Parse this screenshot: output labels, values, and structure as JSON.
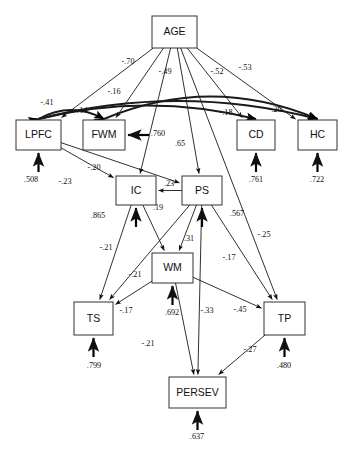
{
  "chart_data": {
    "type": "diagram",
    "diagram_kind": "path-diagram",
    "nodes": [
      {
        "id": "AGE",
        "label": "AGE",
        "x": 152,
        "y": 16,
        "w": 45,
        "h": 32
      },
      {
        "id": "LPFC",
        "label": "LPFC",
        "x": 16,
        "y": 120,
        "w": 45,
        "h": 30
      },
      {
        "id": "FWM",
        "label": "FWM",
        "x": 83,
        "y": 120,
        "w": 42,
        "h": 30
      },
      {
        "id": "CD",
        "label": "CD",
        "x": 237,
        "y": 120,
        "w": 38,
        "h": 30
      },
      {
        "id": "HC",
        "label": "HC",
        "x": 298,
        "y": 120,
        "w": 39,
        "h": 30
      },
      {
        "id": "IC",
        "label": "IC",
        "x": 116,
        "y": 176,
        "w": 40,
        "h": 29
      },
      {
        "id": "PS",
        "label": "PS",
        "x": 182,
        "y": 176,
        "w": 40,
        "h": 29
      },
      {
        "id": "WM",
        "label": "WM",
        "x": 152,
        "y": 253,
        "w": 41,
        "h": 30
      },
      {
        "id": "TS",
        "label": "TS",
        "x": 74,
        "y": 302,
        "w": 39,
        "h": 33
      },
      {
        "id": "TP",
        "label": "TP",
        "x": 264,
        "y": 302,
        "w": 41,
        "h": 33
      },
      {
        "id": "PERSEV",
        "label": "PERSEV",
        "x": 169,
        "y": 377,
        "w": 57,
        "h": 31
      }
    ],
    "paths": [
      {
        "from": "AGE",
        "to": "LPFC",
        "coef": "-.70",
        "label_x": 128,
        "label_y": 62
      },
      {
        "from": "AGE",
        "to": "FWM",
        "coef": "-.49",
        "label_x": 165,
        "label_y": 72
      },
      {
        "from": "AGE",
        "to": "CD",
        "coef": "-.52",
        "label_x": 217,
        "label_y": 72
      },
      {
        "from": "AGE",
        "to": "HC",
        "coef": "-.53",
        "label_x": 245,
        "label_y": 68
      },
      {
        "from": "AGE",
        "to": "IC",
        "coef": "-.18",
        "label_x": 226,
        "label_y": 113
      },
      {
        "from": "AGE",
        "to": "PS",
        "coef": ".65",
        "label_x": 180,
        "label_y": 144
      },
      {
        "from": "LPFC",
        "to": "IC",
        "coef": "-.20",
        "label_x": 94,
        "label_y": 168
      },
      {
        "from": "LPFC",
        "to": "PS",
        "coef": "-.23",
        "label_x": 65,
        "label_y": 182
      },
      {
        "from": "PS",
        "to": "IC",
        "coef": ".23",
        "label_x": 169,
        "label_y": 184
      },
      {
        "from": "IC",
        "to": "WM",
        "coef": ".19",
        "label_x": 158,
        "label_y": 208
      },
      {
        "from": "PS",
        "to": "WM",
        "coef": ".31",
        "label_x": 189,
        "label_y": 239
      },
      {
        "from": "IC",
        "to": "TS",
        "coef": "-.21",
        "label_x": 106,
        "label_y": 248
      },
      {
        "from": "PS",
        "to": "TS",
        "coef": "-.21",
        "label_x": 135,
        "label_y": 275
      },
      {
        "from": "WM",
        "to": "TS",
        "coef": "-.17",
        "label_x": 126,
        "label_y": 311
      },
      {
        "from": "PS",
        "to": "TP",
        "coef": "-.17",
        "label_x": 229,
        "label_y": 258
      },
      {
        "from": "WM",
        "to": "TP",
        "coef": "-.45",
        "label_x": 240,
        "label_y": 310
      },
      {
        "from": "AGE",
        "to": "TP",
        "coef": "-.25",
        "label_x": 264,
        "label_y": 235
      },
      {
        "from": "WM",
        "to": "PERSEV",
        "coef": "-.21",
        "label_x": 148,
        "label_y": 344
      },
      {
        "from": "PS",
        "to": "PERSEV",
        "coef": "-.33",
        "label_x": 207,
        "label_y": 311
      },
      {
        "from": "TP",
        "to": "PERSEV",
        "coef": "-.27",
        "label_x": 250,
        "label_y": 350
      }
    ],
    "correlations": [
      {
        "between": [
          "LPFC",
          "FWM"
        ],
        "coef": "-.14",
        "label_x": 81,
        "label_y": 111
      },
      {
        "between": [
          "LPFC",
          "CD"
        ],
        "coef": "-.41",
        "label_x": 47,
        "label_y": 103
      },
      {
        "between": [
          "LPFC",
          "HC"
        ],
        "coef": "-.16",
        "label_x": 114,
        "label_y": 92
      },
      {
        "between": [
          "FWM",
          "HC"
        ],
        "coef": "-.20",
        "label_x": 275,
        "label_y": 110
      }
    ],
    "residuals": [
      {
        "node": "LPFC",
        "value": ".508",
        "label_x": 31,
        "label_y": 180
      },
      {
        "node": "FWM",
        "value": ".760",
        "label_x": 158,
        "label_y": 134
      },
      {
        "node": "CD",
        "value": ".761",
        "label_x": 256,
        "label_y": 180
      },
      {
        "node": "HC",
        "value": ".722",
        "label_x": 317,
        "label_y": 180
      },
      {
        "node": "IC",
        "value": ".865",
        "label_x": 98,
        "label_y": 216
      },
      {
        "node": "PS",
        "value": ".567",
        "label_x": 237,
        "label_y": 214
      },
      {
        "node": "WM",
        "value": ".692",
        "label_x": 172,
        "label_y": 313
      },
      {
        "node": "TS",
        "value": ".799",
        "label_x": 94,
        "label_y": 366
      },
      {
        "node": "TP",
        "value": ".480",
        "label_x": 284,
        "label_y": 366
      },
      {
        "node": "PERSEV",
        "value": ".637",
        "label_x": 197,
        "label_y": 437
      }
    ]
  }
}
